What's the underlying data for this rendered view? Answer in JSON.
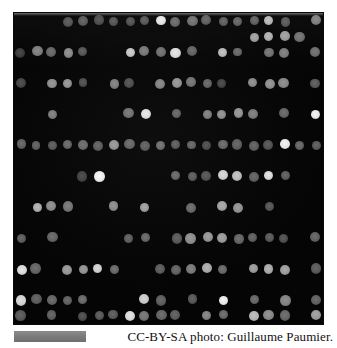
{
  "figure": {
    "kind": "dna-microarray-scan",
    "caption": "CC-BY-SA photo: Guillaume Paumier.",
    "background_color": "#ffffff",
    "panel_color": "#050505",
    "scalebar": {
      "label": "",
      "color": "#7c7c7c",
      "x": 14,
      "y": 331,
      "width": 72,
      "height": 11
    },
    "panel": {
      "x": 14,
      "y": 13,
      "width": 309,
      "height": 311
    }
  },
  "chart_data": {
    "type": "heatmap",
    "title": "",
    "subtitle": "",
    "xlabel": "",
    "ylabel": "",
    "legend": [],
    "grid": false,
    "rows": 20,
    "cols": 20,
    "cell_pitch_x": 15.5,
    "cell_pitch_y": 15.5,
    "origin_x": 7.0,
    "origin_y": 8.0,
    "spot_diameter": 9.6,
    "value_range": [
      0,
      255
    ],
    "colormap": "grayscale",
    "note": "Each value is the measured fluorescence intensity (0-255) of one printed spot; 0 means no spot / background.",
    "values": [
      [
        0,
        0,
        0,
        78,
        84,
        70,
        76,
        74,
        80,
        222,
        96,
        104,
        88,
        86,
        92,
        90,
        176,
        82,
        0,
        120
      ],
      [
        0,
        0,
        0,
        0,
        0,
        0,
        0,
        0,
        0,
        0,
        0,
        0,
        0,
        0,
        0,
        152,
        168,
        150,
        106,
        0
      ],
      [
        56,
        120,
        96,
        130,
        80,
        0,
        0,
        190,
        112,
        104,
        214,
        92,
        0,
        178,
        96,
        0,
        108,
        118,
        0,
        104
      ],
      [
        0,
        0,
        0,
        0,
        0,
        0,
        0,
        0,
        0,
        0,
        0,
        0,
        0,
        0,
        0,
        0,
        0,
        0,
        0,
        0
      ],
      [
        66,
        0,
        136,
        140,
        72,
        0,
        120,
        72,
        0,
        124,
        140,
        108,
        94,
        62,
        0,
        132,
        136,
        130,
        0,
        86
      ],
      [
        0,
        0,
        0,
        0,
        0,
        0,
        0,
        0,
        0,
        0,
        0,
        0,
        0,
        0,
        0,
        0,
        0,
        0,
        0,
        0
      ],
      [
        0,
        0,
        118,
        0,
        0,
        0,
        0,
        106,
        216,
        0,
        92,
        0,
        118,
        136,
        140,
        116,
        0,
        96,
        0,
        226
      ],
      [
        0,
        0,
        0,
        0,
        0,
        0,
        0,
        0,
        0,
        0,
        0,
        0,
        0,
        0,
        0,
        0,
        0,
        0,
        0,
        0
      ],
      [
        92,
        88,
        84,
        96,
        100,
        88,
        140,
        94,
        86,
        102,
        84,
        92,
        70,
        96,
        88,
        88,
        78,
        228,
        96,
        86
      ],
      [
        0,
        0,
        0,
        0,
        0,
        0,
        0,
        0,
        0,
        0,
        0,
        0,
        0,
        0,
        0,
        0,
        0,
        0,
        0,
        0
      ],
      [
        0,
        0,
        0,
        0,
        62,
        232,
        0,
        0,
        0,
        0,
        96,
        84,
        76,
        200,
        180,
        90,
        212,
        88,
        0,
        0
      ],
      [
        0,
        0,
        0,
        0,
        0,
        0,
        0,
        0,
        0,
        0,
        0,
        0,
        0,
        0,
        0,
        0,
        0,
        0,
        0,
        0
      ],
      [
        0,
        168,
        132,
        112,
        0,
        0,
        132,
        0,
        150,
        0,
        0,
        98,
        0,
        156,
        140,
        0,
        80,
        0,
        0,
        0
      ],
      [
        0,
        0,
        0,
        0,
        0,
        0,
        0,
        0,
        0,
        0,
        0,
        0,
        0,
        0,
        0,
        0,
        0,
        0,
        0,
        0
      ],
      [
        88,
        0,
        96,
        0,
        0,
        0,
        0,
        88,
        96,
        0,
        84,
        136,
        142,
        148,
        96,
        90,
        84,
        76,
        0,
        94
      ],
      [
        0,
        0,
        0,
        0,
        0,
        0,
        0,
        0,
        0,
        0,
        0,
        0,
        0,
        0,
        0,
        0,
        0,
        0,
        0,
        0
      ],
      [
        212,
        96,
        0,
        144,
        140,
        200,
        100,
        0,
        0,
        86,
        92,
        116,
        164,
        100,
        0,
        148,
        164,
        152,
        0,
        86
      ],
      [
        0,
        0,
        0,
        0,
        0,
        0,
        0,
        0,
        0,
        0,
        0,
        0,
        0,
        0,
        0,
        0,
        0,
        0,
        0,
        0
      ],
      [
        206,
        88,
        96,
        92,
        100,
        0,
        0,
        0,
        196,
        90,
        0,
        84,
        0,
        228,
        0,
        98,
        0,
        126,
        0,
        92
      ],
      [
        84,
        0,
        90,
        0,
        72,
        84,
        86,
        212,
        110,
        96,
        88,
        0,
        124,
        100,
        0,
        176,
        132,
        98,
        0,
        150
      ]
    ]
  }
}
